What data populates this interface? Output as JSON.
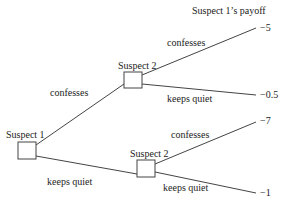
{
  "diagram": {
    "title": "Suspect 1’s payoff",
    "nodes": {
      "root": {
        "label": "Suspect 1"
      },
      "upper": {
        "label": "Suspect 2"
      },
      "lower": {
        "label": "Suspect 2"
      }
    },
    "edges": {
      "root_confesses": "confesses",
      "root_keeps_quiet": "keeps quiet",
      "upper_confesses": "confesses",
      "upper_keeps_quiet": "keeps quiet",
      "lower_confesses": "confesses",
      "lower_keeps_quiet": "keeps quiet"
    },
    "payoffs": {
      "cc": "−5",
      "cq": "−0.5",
      "qc": "−7",
      "qq": "−1"
    }
  }
}
